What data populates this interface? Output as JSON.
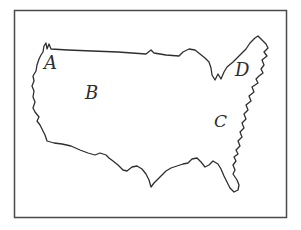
{
  "map_figure": {
    "description": "Hand-drawn outline map of the contiguous United States inside a rectangular frame",
    "ink_color": "#2e2e2e",
    "frame_color": "#4a4a4a",
    "background_color": "#ffffff",
    "labels": {
      "a": "A",
      "b": "B",
      "c": "C",
      "d": "D"
    }
  }
}
